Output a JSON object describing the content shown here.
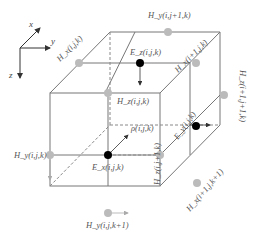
{
  "diagram": {
    "type": "yee-cell",
    "axes": {
      "x": "x",
      "y": "y",
      "z": "z"
    },
    "nodes": {
      "hx_top_left": "H_x(i,j,k)",
      "hy_top": "H_y(i,j+1,k)",
      "ez_top": "E_z(i,j,k)",
      "hx_top_right": "H_x(i+1,j,k)",
      "hz_mid": "H_z(i,j,k)",
      "rho": "ρ(i,j,k)",
      "ey_right": "E_y(i,j,k)",
      "hz_right": "H_z(i+1,j+1,k)",
      "hy_left": "H_y(i,j,k)",
      "ex_center": "E_x(i,j,k)",
      "hz_front": "H_z(i,j+1,k)",
      "hx_front_bottom": "H_x(i+1,j,k+1)",
      "hy_bottom": "H_y(i,j,k+1)"
    },
    "colors": {
      "edge": "#777777",
      "h_node": "#bbbbbb",
      "e_node": "#000000"
    }
  }
}
